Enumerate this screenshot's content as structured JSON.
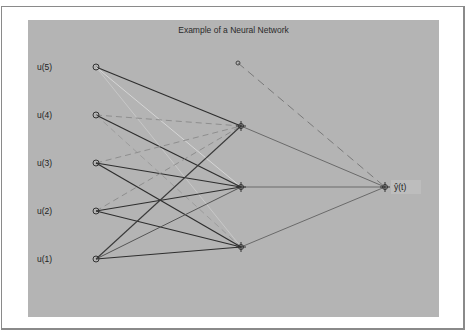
{
  "figure": {
    "title": "Example of a Neural Network",
    "background_color": "#b4b4b4",
    "frame_color": "#ffffff"
  },
  "network": {
    "inputs": [
      {
        "label": "u(5)",
        "x": 96,
        "y": 67
      },
      {
        "label": "u(4)",
        "x": 96,
        "y": 115
      },
      {
        "label": "u(3)",
        "x": 96,
        "y": 163
      },
      {
        "label": "u(2)",
        "x": 96,
        "y": 211
      },
      {
        "label": "u(1)",
        "x": 96,
        "y": 259
      }
    ],
    "bias": {
      "x": 238,
      "y": 63
    },
    "hidden": [
      {
        "x": 241,
        "y": 126
      },
      {
        "x": 241,
        "y": 187
      },
      {
        "x": 241,
        "y": 247
      }
    ],
    "output": {
      "label": "ŷ(t)",
      "x": 385,
      "y": 187
    },
    "connection_legend": {
      "dark_solid": "#2e2e2e",
      "medium_solid": "#6a6a6a",
      "light_solid": "#d6d6d6",
      "light_dashed": "#8e8e8e",
      "bias_dashed": "#7a7a7a"
    }
  }
}
